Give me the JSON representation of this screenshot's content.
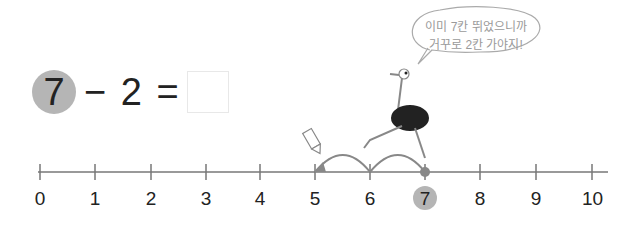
{
  "equation": {
    "start": "7",
    "operator_and_operand": "− 2 =",
    "answer": ""
  },
  "speech_bubble": {
    "line1": "이미 7칸 뛰었으니까",
    "line2": "거꾸로 2칸 가야지!"
  },
  "number_line": {
    "labels": [
      "0",
      "1",
      "2",
      "3",
      "4",
      "5",
      "6",
      "7",
      "8",
      "9",
      "10"
    ],
    "highlighted": "7",
    "jumps": [
      {
        "from": 7,
        "to": 6
      },
      {
        "from": 6,
        "to": 5
      }
    ]
  },
  "colors": {
    "highlight": "#b5b5b5",
    "line": "#777777"
  }
}
